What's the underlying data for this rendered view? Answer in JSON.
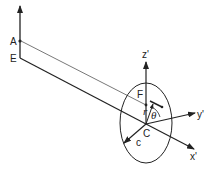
{
  "diagram": {
    "labels": {
      "A": "A",
      "E": "E",
      "F": "F",
      "C": "C",
      "c": "c",
      "z_prime": "z'",
      "y_prime": "y'",
      "x_prime": "x'",
      "r": "r",
      "theta": "θ"
    },
    "colors": {
      "line": "#222222",
      "thin_line": "#555555",
      "background": "#ffffff"
    }
  }
}
